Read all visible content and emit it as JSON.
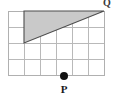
{
  "figure": {
    "background_color": "#ffffff",
    "width": 120,
    "height": 101
  },
  "grid": {
    "columns": 6,
    "rows": 4,
    "cell_width": 16,
    "cell_height": 16,
    "origin_x": 8,
    "origin_y": 11,
    "line_color": "#b9b9b9",
    "border_color": "#b0b0b0"
  },
  "triangle": {
    "name": "shaded-triangle",
    "fill_color": "#c9c9c9",
    "stroke_color": "#4d4d4d",
    "vertices": [
      {
        "label": "top-left",
        "grid_x": 1,
        "grid_y": 0,
        "px_x": 24,
        "px_y": 11
      },
      {
        "label": "top-right",
        "grid_x": 6,
        "grid_y": 0,
        "px_x": 104,
        "px_y": 11
      },
      {
        "label": "bottom-left",
        "grid_x": 1,
        "grid_y": 2,
        "px_x": 24,
        "px_y": 43
      }
    ],
    "base_units": 5,
    "height_units": 2
  },
  "points": [
    {
      "name": "point-p",
      "label": "P",
      "px_x": 64,
      "px_y": 76,
      "grid_x": 3.5,
      "grid_y": 4,
      "dot_radius": 4,
      "dot_color": "#111111",
      "label_px_x": 64,
      "label_px_y": 92
    }
  ],
  "corner_label": {
    "name": "corner-label",
    "text": "Q",
    "px_x": 107,
    "px_y": 4,
    "note": "partially cropped at top edge"
  }
}
